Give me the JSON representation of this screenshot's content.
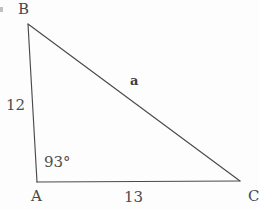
{
  "figure": {
    "type": "geometry-diagram",
    "shape": "triangle",
    "background_color": "#fdfdfd",
    "stroke_color": "#4a4a4a",
    "text_color": "#4a4a4a"
  },
  "vertices": {
    "b": {
      "label": "B",
      "x": 28,
      "y": 24
    },
    "a": {
      "label": "A",
      "x": 37,
      "y": 182
    },
    "c": {
      "label": "C",
      "x": 240,
      "y": 181
    }
  },
  "sides": {
    "ab": {
      "label": "12",
      "from": "A",
      "to": "B"
    },
    "ac": {
      "label": "13",
      "from": "A",
      "to": "C"
    },
    "bc": {
      "label": "a",
      "from": "B",
      "to": "C"
    }
  },
  "angles": {
    "at_a": {
      "label": "93°",
      "value": 93,
      "unit": "degrees",
      "vertex": "A"
    }
  },
  "artifact": {
    "margin_mark": ""
  }
}
